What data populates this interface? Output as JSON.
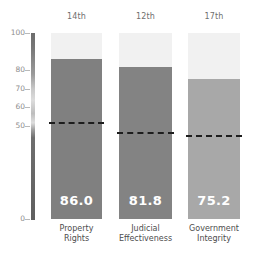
{
  "chart_data": {
    "type": "bar",
    "title": "",
    "subtitle": "",
    "xlabel": "",
    "ylabel": "",
    "ylim": [
      0,
      100
    ],
    "grid": false,
    "legend": "none",
    "categories": [
      "Property\nRights",
      "Judicial\nEffectiveness",
      "Government\nIntegrity"
    ],
    "values": [
      86.0,
      81.8,
      75.2
    ],
    "value_labels": [
      "86.0",
      "81.8",
      "75.2"
    ],
    "rank_labels": [
      "14th",
      "12th",
      "17th"
    ],
    "annotations": {
      "world_average_lines": [
        52.0,
        47.0,
        45.0
      ]
    },
    "yticks": [
      0,
      50,
      60,
      70,
      80,
      100
    ],
    "ytick_labels": [
      "0",
      "50",
      "60",
      "70",
      "80",
      "100"
    ],
    "bar_colors": [
      "#808080",
      "#838383",
      "#a8a8a8"
    ],
    "column_background_color": "#f1f1f1",
    "average_line_color": "#1d1d1d",
    "value_text_color": "#ffffff",
    "axis_label_color": "#8d8d8d",
    "category_label_color": "#4d4d4d",
    "rank_label_color": "#6f6f6f"
  }
}
